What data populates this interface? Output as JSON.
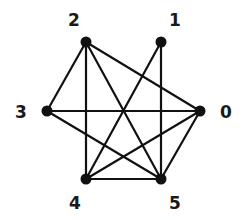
{
  "diagram": {
    "type": "graph",
    "directed": false,
    "colors": {
      "edge": "#111111",
      "node": "#111111",
      "label": "#1a1a1a",
      "background": "#ffffff"
    },
    "nodes": [
      {
        "id": "0",
        "label": "0",
        "x": 200,
        "y": 111,
        "lx": 226,
        "ly": 112
      },
      {
        "id": "1",
        "label": "1",
        "x": 161,
        "y": 42,
        "lx": 175,
        "ly": 20
      },
      {
        "id": "2",
        "label": "2",
        "x": 86,
        "y": 42,
        "lx": 74,
        "ly": 20
      },
      {
        "id": "3",
        "label": "3",
        "x": 47,
        "y": 111,
        "lx": 21,
        "ly": 112
      },
      {
        "id": "4",
        "label": "4",
        "x": 86,
        "y": 179,
        "lx": 75,
        "ly": 203
      },
      {
        "id": "5",
        "label": "5",
        "x": 161,
        "y": 179,
        "lx": 175,
        "ly": 203
      }
    ],
    "edges": [
      [
        "2",
        "3"
      ],
      [
        "2",
        "4"
      ],
      [
        "2",
        "5"
      ],
      [
        "2",
        "0"
      ],
      [
        "1",
        "4"
      ],
      [
        "1",
        "5"
      ],
      [
        "3",
        "0"
      ],
      [
        "3",
        "5"
      ],
      [
        "0",
        "4"
      ],
      [
        "0",
        "5"
      ],
      [
        "4",
        "5"
      ]
    ]
  }
}
